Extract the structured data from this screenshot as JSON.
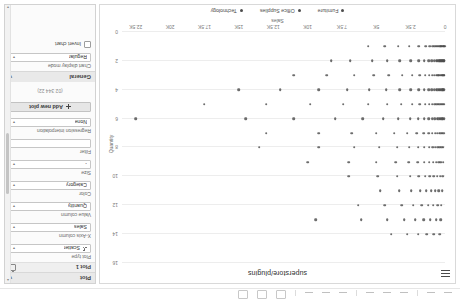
{
  "toolbar": {
    "buttons": [
      "undo",
      "redo",
      "cut",
      "copy",
      "paste",
      "bold",
      "italic",
      "align",
      "zoom-out",
      "zoom-in",
      "fit"
    ],
    "status": ""
  },
  "chart": {
    "title": "superstore/plugins",
    "menu_icon": "hamburger-icon",
    "xlabel": "Sales",
    "ylabel": "Quantity",
    "legend": [
      {
        "label": "Furniture",
        "color": "#4d4d4d"
      },
      {
        "label": "Office Supplies",
        "color": "#4d4d4d"
      },
      {
        "label": "Technology",
        "color": "#4d4d4d"
      }
    ]
  },
  "chart_data": {
    "type": "scatter",
    "title": "superstore/plugins",
    "xlabel": "Sales",
    "ylabel": "Quantity",
    "xlim": [
      0,
      23500
    ],
    "ylim": [
      0,
      16
    ],
    "grid": true,
    "legend_position": "bottom",
    "xticks": [
      0,
      2500,
      5000,
      7500,
      10000,
      12500,
      15000,
      17500,
      20000,
      22500
    ],
    "xticklabels": [
      "0",
      "2.5K",
      "5K",
      "7.5K",
      "10K",
      "12.5K",
      "15K",
      "17.5K",
      "20K",
      "22.5K"
    ],
    "yticks": [
      0,
      2,
      4,
      6,
      8,
      10,
      12,
      14,
      16
    ],
    "yticklabels": [
      "0",
      "2",
      "4",
      "6",
      "8",
      "10",
      "12",
      "14",
      "16"
    ],
    "series": [
      {
        "name": "Furniture",
        "color": "#4d4d4d",
        "points": [
          [
            30,
            1
          ],
          [
            70,
            1
          ],
          [
            110,
            1
          ],
          [
            150,
            1
          ],
          [
            200,
            1
          ],
          [
            260,
            1
          ],
          [
            320,
            1
          ],
          [
            400,
            1
          ],
          [
            480,
            1
          ],
          [
            560,
            1
          ],
          [
            650,
            1
          ],
          [
            760,
            1
          ],
          [
            900,
            1
          ],
          [
            1100,
            1
          ],
          [
            1400,
            1
          ],
          [
            1900,
            1
          ],
          [
            2600,
            1
          ],
          [
            3400,
            1
          ],
          [
            4400,
            1
          ],
          [
            5600,
            1
          ],
          [
            40,
            2
          ],
          [
            90,
            2
          ],
          [
            140,
            2
          ],
          [
            190,
            2
          ],
          [
            250,
            2
          ],
          [
            310,
            2
          ],
          [
            380,
            2
          ],
          [
            460,
            2
          ],
          [
            550,
            2
          ],
          [
            660,
            2
          ],
          [
            800,
            2
          ],
          [
            980,
            2
          ],
          [
            1200,
            2
          ],
          [
            1500,
            2
          ],
          [
            1900,
            2
          ],
          [
            2500,
            2
          ],
          [
            3300,
            2
          ],
          [
            4200,
            2
          ],
          [
            5300,
            2
          ],
          [
            6900,
            2
          ],
          [
            8300,
            2
          ],
          [
            50,
            3
          ],
          [
            100,
            3
          ],
          [
            160,
            3
          ],
          [
            220,
            3
          ],
          [
            290,
            3
          ],
          [
            370,
            3
          ],
          [
            450,
            3
          ],
          [
            540,
            3
          ],
          [
            650,
            3
          ],
          [
            780,
            3
          ],
          [
            950,
            3
          ],
          [
            1150,
            3
          ],
          [
            1450,
            3
          ],
          [
            1850,
            3
          ],
          [
            2400,
            3
          ],
          [
            3100,
            3
          ],
          [
            4100,
            3
          ],
          [
            5200,
            3
          ],
          [
            6600,
            3
          ],
          [
            8600,
            3
          ],
          [
            11000,
            3
          ],
          [
            60,
            4
          ],
          [
            120,
            4
          ],
          [
            180,
            4
          ],
          [
            250,
            4
          ],
          [
            330,
            4
          ],
          [
            420,
            4
          ],
          [
            520,
            4
          ],
          [
            640,
            4
          ],
          [
            790,
            4
          ],
          [
            970,
            4
          ],
          [
            1200,
            4
          ],
          [
            1500,
            4
          ],
          [
            1900,
            4
          ],
          [
            2500,
            4
          ],
          [
            3300,
            4
          ],
          [
            4300,
            4
          ],
          [
            5500,
            4
          ],
          [
            7100,
            4
          ],
          [
            9200,
            4
          ],
          [
            12000,
            4
          ],
          [
            15000,
            4
          ],
          [
            70,
            5
          ],
          [
            140,
            5
          ],
          [
            210,
            5
          ],
          [
            290,
            5
          ],
          [
            380,
            5
          ],
          [
            480,
            5
          ],
          [
            600,
            5
          ],
          [
            740,
            5
          ],
          [
            920,
            5
          ],
          [
            1150,
            5
          ],
          [
            1450,
            5
          ],
          [
            1850,
            5
          ],
          [
            2400,
            5
          ],
          [
            3200,
            5
          ],
          [
            4200,
            5
          ],
          [
            5600,
            5
          ],
          [
            7400,
            5
          ],
          [
            9800,
            5
          ],
          [
            13000,
            5
          ],
          [
            17500,
            5
          ],
          [
            80,
            6
          ],
          [
            160,
            6
          ],
          [
            250,
            6
          ],
          [
            350,
            6
          ],
          [
            460,
            6
          ],
          [
            590,
            6
          ],
          [
            740,
            6
          ],
          [
            930,
            6
          ],
          [
            1180,
            6
          ],
          [
            1500,
            6
          ],
          [
            1950,
            6
          ],
          [
            2550,
            6
          ],
          [
            3400,
            6
          ],
          [
            4500,
            6
          ],
          [
            6000,
            6
          ],
          [
            8000,
            6
          ],
          [
            11000,
            6
          ],
          [
            14500,
            6
          ],
          [
            22500,
            6
          ],
          [
            100,
            7
          ],
          [
            200,
            7
          ],
          [
            310,
            7
          ],
          [
            430,
            7
          ],
          [
            570,
            7
          ],
          [
            730,
            7
          ],
          [
            930,
            7
          ],
          [
            1200,
            7
          ],
          [
            1550,
            7
          ],
          [
            2050,
            7
          ],
          [
            2750,
            7
          ],
          [
            3700,
            7
          ],
          [
            5000,
            7
          ],
          [
            6800,
            7
          ],
          [
            9200,
            7
          ],
          [
            13000,
            7
          ],
          [
            120,
            8
          ],
          [
            240,
            8
          ],
          [
            380,
            8
          ],
          [
            530,
            8
          ],
          [
            700,
            8
          ],
          [
            900,
            8
          ],
          [
            1150,
            8
          ],
          [
            1500,
            8
          ],
          [
            1950,
            8
          ],
          [
            2600,
            8
          ],
          [
            3500,
            8
          ],
          [
            4800,
            8
          ],
          [
            6600,
            8
          ],
          [
            9200,
            8
          ],
          [
            13500,
            8
          ],
          [
            150,
            9
          ],
          [
            300,
            9
          ],
          [
            470,
            9
          ],
          [
            660,
            9
          ],
          [
            880,
            9
          ],
          [
            1150,
            9
          ],
          [
            1500,
            9
          ],
          [
            1980,
            9
          ],
          [
            2650,
            9
          ],
          [
            3600,
            9
          ],
          [
            5000,
            9
          ],
          [
            7000,
            9
          ],
          [
            10000,
            9
          ],
          [
            180,
            10
          ],
          [
            370,
            10
          ],
          [
            580,
            10
          ],
          [
            820,
            10
          ],
          [
            1100,
            10
          ],
          [
            1450,
            10
          ],
          [
            1900,
            10
          ],
          [
            2550,
            10
          ],
          [
            3500,
            10
          ],
          [
            4900,
            10
          ],
          [
            7000,
            10
          ],
          [
            220,
            11
          ],
          [
            450,
            11
          ],
          [
            710,
            11
          ],
          [
            1010,
            11
          ],
          [
            1370,
            11
          ],
          [
            1820,
            11
          ],
          [
            2450,
            11
          ],
          [
            3350,
            11
          ],
          [
            4700,
            11
          ],
          [
            260,
            12
          ],
          [
            540,
            12
          ],
          [
            860,
            12
          ],
          [
            1240,
            12
          ],
          [
            1700,
            12
          ],
          [
            2300,
            12
          ],
          [
            3150,
            12
          ],
          [
            4400,
            12
          ],
          [
            6300,
            12
          ],
          [
            320,
            13
          ],
          [
            660,
            13
          ],
          [
            1060,
            13
          ],
          [
            1540,
            13
          ],
          [
            2150,
            13
          ],
          [
            2950,
            13
          ],
          [
            4200,
            13
          ],
          [
            6100,
            13
          ],
          [
            9400,
            13
          ],
          [
            400,
            14
          ],
          [
            820,
            14
          ],
          [
            1320,
            14
          ],
          [
            1930,
            14
          ],
          [
            2750,
            14
          ],
          [
            3900,
            14
          ]
        ]
      }
    ],
    "note": "Dense overlapping clusters near low Sales values at every integer Quantity level; tails extend to ~22.5K Sales."
  },
  "panel": {
    "sections": [
      {
        "id": "plot",
        "header": "Plot",
        "collapse_icon": "chevron-icon",
        "subsection": {
          "title": "Plot 1",
          "delete_icon": "trash-icon"
        },
        "fields": [
          {
            "label": "Plot type",
            "value": "Scatter",
            "icon": "scatter-icon"
          },
          {
            "label": "X-Axis column",
            "value": "Sales"
          },
          {
            "label": "Value column",
            "value": "Quantity"
          },
          {
            "label": "Color",
            "value": "Category"
          },
          {
            "label": "Size",
            "value": "-"
          },
          {
            "label": "Filter",
            "value": ""
          },
          {
            "label": "Regression interpolation",
            "value": "None"
          }
        ],
        "add_button": {
          "label": "Add new plot",
          "icon": "plus-icon"
        },
        "meta": "(02 344 22)"
      },
      {
        "id": "general",
        "header": "General",
        "collapse_icon": "chevron-icon",
        "fields": [
          {
            "label": "Chart display mode",
            "value": "Regular"
          }
        ],
        "checkbox": {
          "label": "Invert chart",
          "checked": false
        }
      }
    ],
    "scrollbar": {
      "up_arrow": "chevron-up-icon",
      "down_arrow": "chevron-down-icon"
    }
  },
  "colors": {
    "accent": "#4d4d4d",
    "panel_bg": "#fbfbfb",
    "section_header_bg": "#e9e9e9",
    "grid": "#ededed"
  }
}
